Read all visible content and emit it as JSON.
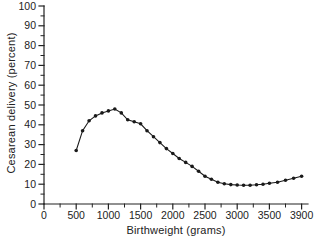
{
  "figure": {
    "background_color": "#ffffff",
    "axis_color": "#222222",
    "text_color": "#222222",
    "series_color": "#1a1a1a"
  },
  "chart_data": {
    "type": "line",
    "title": "",
    "xlabel": "Birthweight (grams)",
    "ylabel": "Cesarean delivery (percent)",
    "x": [
      500,
      600,
      700,
      800,
      900,
      1000,
      1100,
      1200,
      1300,
      1400,
      1500,
      1600,
      1700,
      1800,
      1900,
      2000,
      2100,
      2200,
      2300,
      2400,
      2500,
      2600,
      2700,
      2800,
      2900,
      3000,
      3100,
      3200,
      3300,
      3400,
      3500,
      3600,
      3700,
      3800,
      3900
    ],
    "y": [
      27,
      37,
      42,
      44.5,
      46,
      47,
      48,
      46,
      42.5,
      41.5,
      40.5,
      37,
      34,
      31,
      28,
      25.5,
      23,
      21,
      19,
      16.5,
      14,
      12.5,
      11,
      10.2,
      9.8,
      9.6,
      9.5,
      9.5,
      9.7,
      10,
      10.5,
      11,
      12,
      13,
      14
    ],
    "x_tick_labels": [
      "0",
      "500",
      "1000",
      "1500",
      "2000",
      "2500",
      "3000",
      "3500",
      "3900"
    ],
    "y_tick_labels": [
      "0",
      "10",
      "20",
      "30",
      "40",
      "50",
      "60",
      "70",
      "80",
      "90",
      "100"
    ],
    "y_ticks": [
      0,
      10,
      20,
      30,
      40,
      50,
      60,
      70,
      80,
      90,
      100
    ],
    "ylim": [
      0,
      100
    ],
    "grid": false,
    "legend": null,
    "marker": "circle",
    "line_color": "#1a1a1a",
    "marker_color": "#1a1a1a"
  }
}
